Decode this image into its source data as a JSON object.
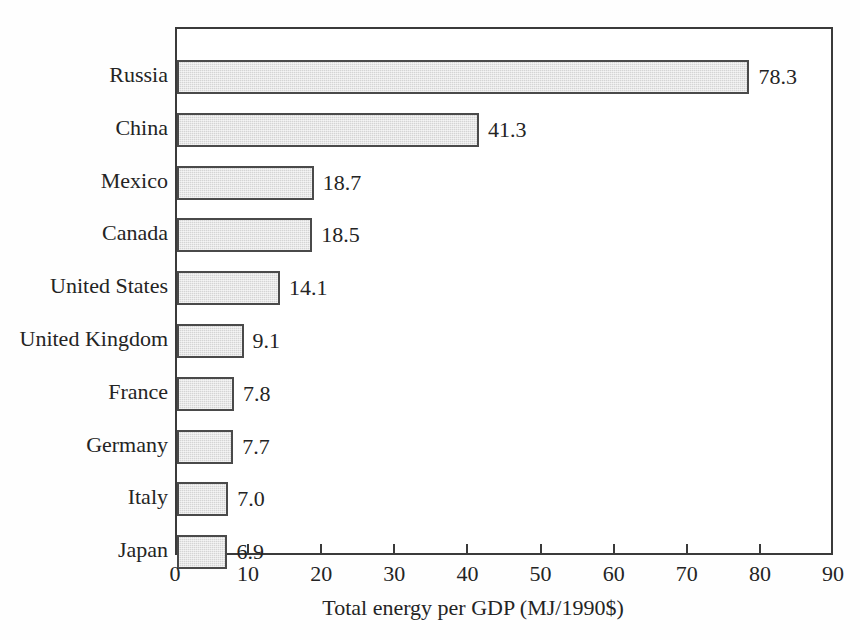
{
  "chart_data": {
    "type": "bar",
    "orientation": "horizontal",
    "title": "",
    "xlabel": "Total energy per GDP (MJ/1990$)",
    "ylabel": "",
    "xlim": [
      0,
      90
    ],
    "xticks": [
      0,
      10,
      20,
      30,
      40,
      50,
      60,
      70,
      80,
      90
    ],
    "xticklabels": [
      "0",
      "10",
      "20",
      "30",
      "40",
      "50",
      "60",
      "70",
      "80",
      "90"
    ],
    "grid": false,
    "legend": false,
    "categories": [
      "Russia",
      "China",
      "Mexico",
      "Canada",
      "United States",
      "United Kingdom",
      "France",
      "Germany",
      "Italy",
      "Japan"
    ],
    "values": [
      78.3,
      41.3,
      18.7,
      18.5,
      14.1,
      9.1,
      7.8,
      7.7,
      7.0,
      6.9
    ],
    "value_labels": [
      "78.3",
      "41.3",
      "18.7",
      "18.5",
      "14.1",
      "9.1",
      "7.8",
      "7.7",
      "7.0",
      "6.9"
    ],
    "bars": [
      {
        "category": "Russia",
        "value": 78.3,
        "label": "78.3"
      },
      {
        "category": "China",
        "value": 41.3,
        "label": "41.3"
      },
      {
        "category": "Mexico",
        "value": 18.7,
        "label": "18.7"
      },
      {
        "category": "Canada",
        "value": 18.5,
        "label": "18.5"
      },
      {
        "category": "United States",
        "value": 14.1,
        "label": "14.1"
      },
      {
        "category": "United Kingdom",
        "value": 9.1,
        "label": "9.1"
      },
      {
        "category": "France",
        "value": 7.8,
        "label": "7.8"
      },
      {
        "category": "Germany",
        "value": 7.7,
        "label": "7.7"
      },
      {
        "category": "Italy",
        "value": 7.0,
        "label": "7.0"
      },
      {
        "category": "Japan",
        "value": 6.9,
        "label": "6.9"
      }
    ],
    "colors": {
      "bar_fill": "#d4d4d4",
      "bar_edge": "#4a4a4a",
      "frame": "#3a3a3a",
      "text": "#242424",
      "background": "#ffffff"
    }
  }
}
